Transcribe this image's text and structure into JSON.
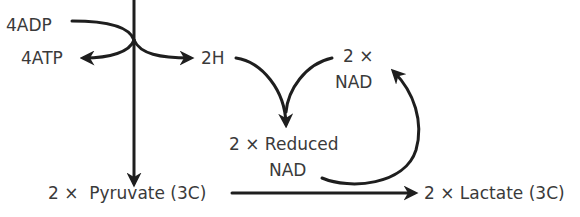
{
  "diagram": {
    "type": "metabolic-pathway",
    "nodes": {
      "adp": "4ADP",
      "atp": "4ATP",
      "hydrogen": "2H",
      "nad_line1": "2 ×",
      "nad_line2": "NAD",
      "reduced_nad_line1": "2 × Reduced",
      "reduced_nad_line2": "NAD",
      "pyruvate": "2 ×  Pyruvate (3C)",
      "lactate": "2 × Lactate (3C)"
    },
    "edges": [
      {
        "from": "glucose (above)",
        "to": "2 × Pyruvate (3C)"
      },
      {
        "from": "4ADP",
        "to": "4ATP"
      },
      {
        "from": "pathway",
        "to": "2H"
      },
      {
        "from": "2H",
        "to": "2 × Reduced NAD"
      },
      {
        "from": "2 × NAD",
        "to": "2 × Reduced NAD"
      },
      {
        "from": "2 × Reduced NAD",
        "to": "2 × NAD"
      },
      {
        "from": "2 × Pyruvate (3C)",
        "to": "2 × Lactate (3C)"
      }
    ],
    "colors": {
      "line": "#1e1e1e",
      "text": "#3a3a3a",
      "background": "#ffffff"
    }
  }
}
